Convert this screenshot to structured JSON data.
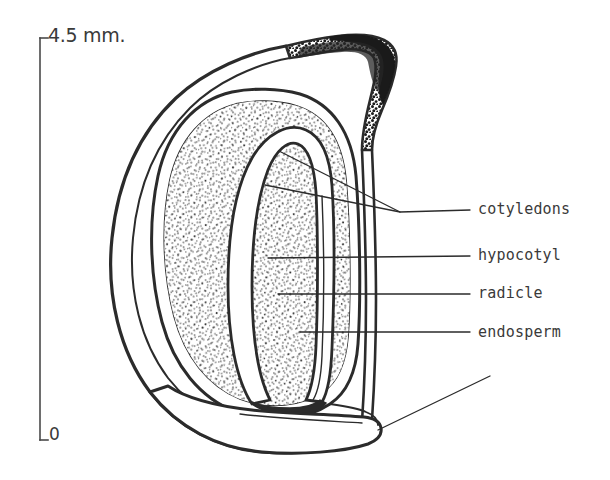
{
  "figure": {
    "kind": "botanical-line-drawing",
    "background_color": "#ffffff",
    "ink_color": "#2b2b2b"
  },
  "scale_bar": {
    "top_label": "4.5 mm.",
    "bottom_label": "0",
    "x": 40,
    "y_top": 38,
    "y_bottom": 440
  },
  "labels": [
    {
      "id": "cotyledons",
      "text": "cotyledons",
      "x": 478,
      "y": 210
    },
    {
      "id": "hypocotyl",
      "text": "hypocotyl",
      "x": 478,
      "y": 256
    },
    {
      "id": "radicle",
      "text": "radicle",
      "x": 478,
      "y": 294
    },
    {
      "id": "endosperm",
      "text": "endosperm",
      "x": 478,
      "y": 333
    }
  ],
  "leaders": [
    {
      "id": "cotyledons-leader-a",
      "points": "265,185 400,212 470,210"
    },
    {
      "id": "cotyledons-leader-b",
      "points": "279,151 400,212"
    },
    {
      "id": "cotyledons-leader-tail",
      "points": "400,212 470,210"
    },
    {
      "id": "hypocotyl-leader",
      "points": "268,258 470,256"
    },
    {
      "id": "radicle-leader",
      "points": "278,294 470,294"
    },
    {
      "id": "endosperm-leader",
      "points": "300,332 470,332"
    },
    {
      "id": "beak-leader",
      "points": "378,430 490,376"
    }
  ],
  "structures": {
    "testa_outer": "outer seed coat outline",
    "hilum_patch": "dark stippled hilum / raphe region, upper right",
    "endosperm_field": "stippled endosperm tissue",
    "embryo": "white hook-shaped embryo: cotyledons, hypocotyl, radicle",
    "beak": "protruding basal beak at lower right"
  }
}
